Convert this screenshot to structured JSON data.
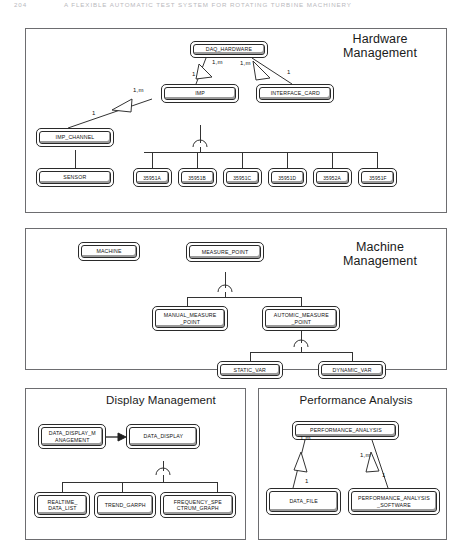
{
  "page_header": {
    "page_number": "204",
    "running_title": "A FLEXIBLE AUTOMATIC TEST SYSTEM FOR ROTATING TURBINE MACHINERY"
  },
  "panels": [
    {
      "id": "hardware",
      "title": "Hardware\nManagement",
      "nodes": [
        {
          "key": "daq_hardware",
          "label": "DAQ_HARDWARE"
        },
        {
          "key": "imp",
          "label": "IMP"
        },
        {
          "key": "interface_card",
          "label": "INTERFACE_CARD"
        },
        {
          "key": "imp_channel",
          "label": "IMP_CHANNEL"
        },
        {
          "key": "sensor",
          "label": "SENSOR"
        },
        {
          "key": "m35951a",
          "label": "35951A"
        },
        {
          "key": "m35951b",
          "label": "35951B"
        },
        {
          "key": "m35951c",
          "label": "35951C"
        },
        {
          "key": "m35951d",
          "label": "35951D"
        },
        {
          "key": "m35952a",
          "label": "35952A"
        },
        {
          "key": "m35951f",
          "label": "35951F"
        }
      ],
      "multiplicities": [
        {
          "key": "daq_imp_many",
          "text": "1,m"
        },
        {
          "key": "daq_imp_one",
          "text": "1"
        },
        {
          "key": "daq_card_many",
          "text": "1,m"
        },
        {
          "key": "daq_card_one",
          "text": "1"
        },
        {
          "key": "imp_chan_many",
          "text": "1,m"
        },
        {
          "key": "imp_chan_one",
          "text": "1"
        }
      ]
    },
    {
      "id": "machine",
      "title": "Machine\nManagement",
      "nodes": [
        {
          "key": "machine",
          "label": "MACHINE"
        },
        {
          "key": "measure_point",
          "label": "MEASURE_POINT"
        },
        {
          "key": "manual_point",
          "label": "MANUAL_MEASURE\n_POINT"
        },
        {
          "key": "automic_point",
          "label": "AUTOMIC_MEASURE\n_POINT"
        },
        {
          "key": "static_var",
          "label": "STATIC_VAR"
        },
        {
          "key": "dynamic_var",
          "label": "DYNAMIC_VAR"
        }
      ],
      "multiplicities": []
    },
    {
      "id": "display",
      "title": "Display Management",
      "nodes": [
        {
          "key": "display_mgmt",
          "label": "DATA_DISPLAY_M\nANAGEMENT"
        },
        {
          "key": "data_display",
          "label": "DATA_DISPLAY"
        },
        {
          "key": "realtime_list",
          "label": "REALTIME_\nDATA_LIST"
        },
        {
          "key": "trend_graph",
          "label": "TREND_GARPH"
        },
        {
          "key": "freq_graph",
          "label": "FREQUENCY_SPE\nCTRUM_GRAPH"
        }
      ],
      "multiplicities": []
    },
    {
      "id": "performance",
      "title": "Performance Analysis",
      "nodes": [
        {
          "key": "perf_analysis",
          "label": "PERFORMANCE_ANALYSIS"
        },
        {
          "key": "data_file",
          "label": "DATA_FILE"
        },
        {
          "key": "perf_software",
          "label": "PERFORMANCE_ANALYSIS\n_SOFTWARE"
        }
      ],
      "multiplicities": [
        {
          "key": "perf_file_many",
          "text": "1,m"
        },
        {
          "key": "perf_file_one",
          "text": "1"
        },
        {
          "key": "perf_sw_many",
          "text": "1,m"
        },
        {
          "key": "perf_sw_one",
          "text": "1"
        }
      ]
    }
  ]
}
